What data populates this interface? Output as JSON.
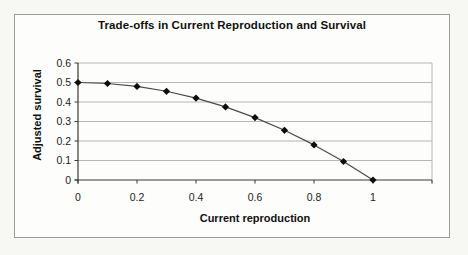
{
  "chart": {
    "title": "Trade-offs in Current Reproduction and Survival",
    "xlabel": "Current reproduction",
    "ylabel": "Adjusted survival"
  },
  "chart_data": {
    "type": "line",
    "title": "Trade-offs in Current Reproduction and Survival",
    "xlabel": "Current reproduction",
    "ylabel": "Adjusted survival",
    "x": [
      0,
      0.1,
      0.2,
      0.3,
      0.4,
      0.5,
      0.6,
      0.7,
      0.8,
      0.9,
      1
    ],
    "y": [
      0.5,
      0.495,
      0.48,
      0.455,
      0.42,
      0.375,
      0.32,
      0.255,
      0.18,
      0.095,
      0
    ],
    "xlim": [
      0,
      1.2
    ],
    "ylim": [
      0,
      0.6
    ],
    "x_ticks": [
      0,
      0.2,
      0.4,
      0.6,
      0.8,
      1,
      1.2
    ],
    "x_tick_labels": [
      "0",
      "0.2",
      "0.4",
      "0.6",
      "0.8",
      "1",
      ""
    ],
    "y_ticks": [
      0,
      0.1,
      0.2,
      0.3,
      0.4,
      0.5,
      0.6
    ],
    "y_tick_labels": [
      "0",
      "0.1",
      "0.2",
      "0.3",
      "0.4",
      "0.5",
      "0.6"
    ],
    "grid": "horizontal-only",
    "legend": "none",
    "marker": "diamond",
    "marker_size": 3.6,
    "colors": {
      "line": "#4a4a4a",
      "marker": "#0d0d0d",
      "gridline": "#b6b6b4",
      "axis": "#3a3a3a",
      "tick_text": "#1c1c1c",
      "frame_border": "#9a9a9a",
      "plot_background": "#fdfdfb"
    }
  }
}
